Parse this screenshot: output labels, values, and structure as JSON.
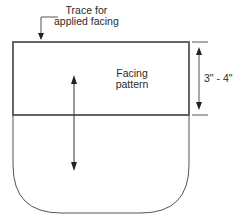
{
  "diagram": {
    "callout_label_line1": "Trace for",
    "callout_label_line2": "applied facing",
    "facing_label_line1": "Facing",
    "facing_label_line2": "pattern",
    "dimension_label": "3\" - 4\"",
    "colors": {
      "stroke": "#555555",
      "text": "#2a2a2a",
      "background": "#ffffff"
    }
  }
}
